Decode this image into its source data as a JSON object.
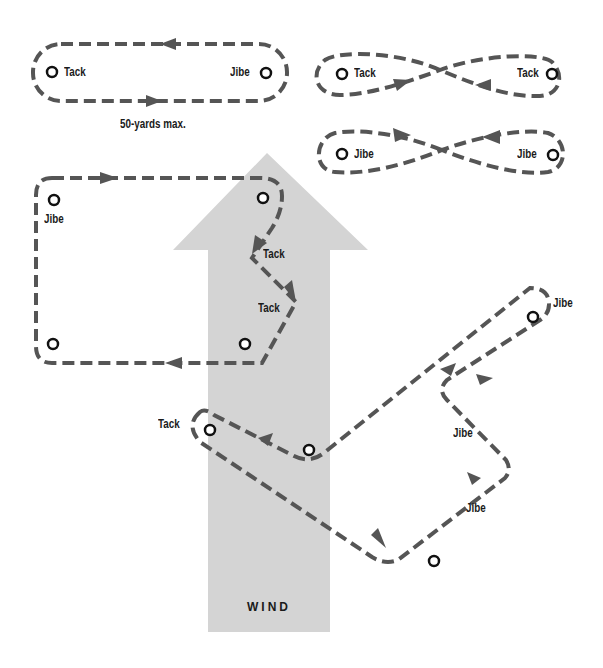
{
  "colors": {
    "wind_arrow": "#d4d4d4",
    "course_line": "#555555",
    "mark": "#111111",
    "text": "#1a1a1a"
  },
  "wind": {
    "label": "WIND",
    "direction": "up"
  },
  "drills": {
    "oval": {
      "left_label": "Tack",
      "right_label": "Jibe",
      "caption": "50-yards max."
    },
    "figure8_tack": {
      "left_label": "Tack",
      "right_label": "Tack"
    },
    "figure8_jibe": {
      "left_label": "Jibe",
      "right_label": "Jibe"
    },
    "box_course": {
      "top_left_label": "Jibe",
      "tack1_label": "Tack",
      "tack2_label": "Tack"
    },
    "zigzag_course": {
      "left_label": "Tack",
      "top_right_label": "Jibe",
      "middle_right_label": "Jibe",
      "lower_right_label": "Jibe"
    }
  }
}
